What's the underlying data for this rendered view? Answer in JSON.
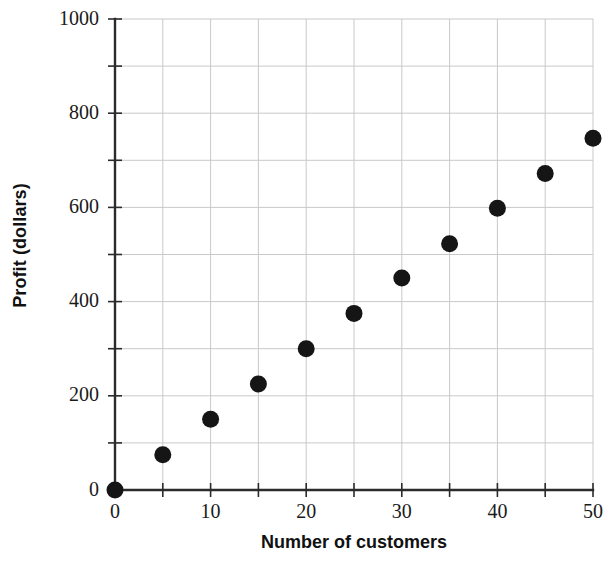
{
  "chart_data": {
    "type": "scatter",
    "title": "",
    "xlabel": "Number of customers",
    "ylabel": "Profit (dollars)",
    "xlim": [
      0,
      50
    ],
    "ylim": [
      0,
      1000
    ],
    "grid": true,
    "legend": "none",
    "x_major_ticks": [
      0,
      10,
      20,
      30,
      40,
      50
    ],
    "x_minor_ticks": [
      5,
      15,
      25,
      35,
      45
    ],
    "y_major_ticks": [
      0,
      200,
      400,
      600,
      800,
      1000
    ],
    "y_minor_ticks": [
      100,
      300,
      500,
      700,
      900
    ],
    "x_tick_labels": [
      "0",
      "10",
      "20",
      "30",
      "40",
      "50"
    ],
    "y_tick_labels": [
      "0",
      "200",
      "400",
      "600",
      "800",
      "1000"
    ],
    "marker": "filled-circle",
    "marker_color": "#151515",
    "grid_color": "#c9c9c9",
    "axis_color": "#2b2b2b",
    "x": [
      0,
      5,
      10,
      15,
      20,
      25,
      30,
      35,
      40,
      45,
      50
    ],
    "values": [
      0,
      75,
      150,
      225,
      300,
      375,
      450,
      523,
      598,
      672,
      747
    ],
    "points": [
      {
        "x": 0,
        "y": 0
      },
      {
        "x": 5,
        "y": 75
      },
      {
        "x": 10,
        "y": 150
      },
      {
        "x": 15,
        "y": 225
      },
      {
        "x": 20,
        "y": 300
      },
      {
        "x": 25,
        "y": 375
      },
      {
        "x": 30,
        "y": 450
      },
      {
        "x": 35,
        "y": 523
      },
      {
        "x": 40,
        "y": 598
      },
      {
        "x": 45,
        "y": 672
      },
      {
        "x": 50,
        "y": 747
      }
    ]
  }
}
